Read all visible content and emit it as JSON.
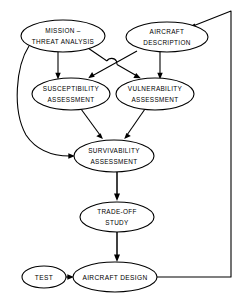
{
  "diagram": {
    "background_color": "#ffffff",
    "line_color": "#000000",
    "nodes": [
      {
        "id": "mission-threat-analysis",
        "label_line1": "MISSION –",
        "label_line2": "THREAT ANALYSIS",
        "cx": 63,
        "cy": 36,
        "rx": 42,
        "ry": 16
      },
      {
        "id": "aircraft-description",
        "label_line1": "AIRCRAFT",
        "label_line2": "DESCRIPTION",
        "cx": 167,
        "cy": 37,
        "rx": 41,
        "ry": 15
      },
      {
        "id": "susceptibility-assessment",
        "label_line1": "SUSCEPTIBILITY",
        "label_line2": "ASSESSMENT",
        "cx": 71,
        "cy": 94,
        "rx": 39,
        "ry": 16
      },
      {
        "id": "vulnerability-assessment",
        "label_line1": "VULNERABILITY",
        "label_line2": "ASSESSMENT",
        "cx": 155,
        "cy": 94,
        "rx": 39,
        "ry": 16
      },
      {
        "id": "survivability-assessment",
        "label_line1": "SURVIVABILITY",
        "label_line2": "ASSESSMENT",
        "cx": 114,
        "cy": 156,
        "rx": 40,
        "ry": 16
      },
      {
        "id": "trade-off-study",
        "label_line1": "TRADE-OFF",
        "label_line2": "STUDY",
        "cx": 117,
        "cy": 217,
        "rx": 37,
        "ry": 15
      },
      {
        "id": "test",
        "label_line1": "TEST",
        "label_line2": "",
        "cx": 44,
        "cy": 277,
        "rx": 22,
        "ry": 11
      },
      {
        "id": "aircraft-design",
        "label_line1": "AIRCRAFT DESIGN",
        "label_line2": "",
        "cx": 115,
        "cy": 277,
        "rx": 42,
        "ry": 15
      }
    ],
    "edges": [
      {
        "id": "mission-to-susceptibility",
        "from": "mission-threat-analysis",
        "to": "susceptibility-assessment"
      },
      {
        "id": "mission-to-vulnerability",
        "from": "mission-threat-analysis",
        "to": "vulnerability-assessment"
      },
      {
        "id": "mission-to-survivability",
        "from": "mission-threat-analysis",
        "to": "survivability-assessment"
      },
      {
        "id": "description-to-susceptibility",
        "from": "aircraft-description",
        "to": "susceptibility-assessment"
      },
      {
        "id": "description-to-vulnerability",
        "from": "aircraft-description",
        "to": "vulnerability-assessment"
      },
      {
        "id": "susceptibility-to-survivability",
        "from": "susceptibility-assessment",
        "to": "survivability-assessment"
      },
      {
        "id": "vulnerability-to-survivability",
        "from": "vulnerability-assessment",
        "to": "survivability-assessment"
      },
      {
        "id": "survivability-to-tradeoff",
        "from": "survivability-assessment",
        "to": "trade-off-study"
      },
      {
        "id": "tradeoff-to-design",
        "from": "trade-off-study",
        "to": "aircraft-design"
      },
      {
        "id": "test-to-design",
        "from": "test",
        "to": "aircraft-design"
      },
      {
        "id": "design-feedback-to-description",
        "from": "aircraft-design",
        "to": "aircraft-description"
      }
    ]
  }
}
